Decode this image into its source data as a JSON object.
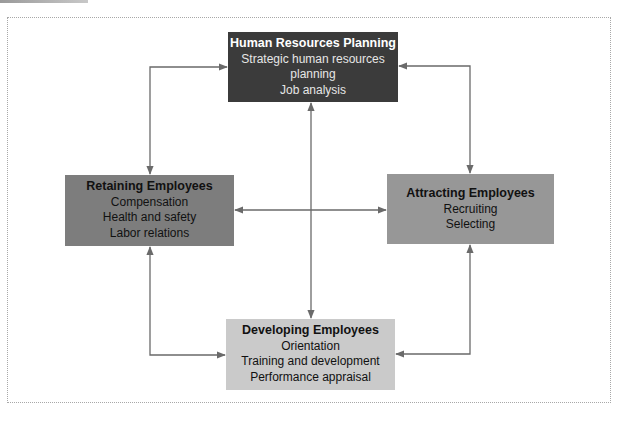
{
  "diagram": {
    "colors": {
      "hr_planning": "#3b3b3b",
      "retaining": "#7d7d7d",
      "attracting": "#979797",
      "developing": "#cacaca",
      "arrow": "#6a6a6a",
      "frame_border": "#a8a8a8"
    },
    "boxes": {
      "hr_planning": {
        "title": "Human Resources Planning",
        "items": [
          "Strategic human resources",
          "planning",
          "Job analysis"
        ]
      },
      "retaining": {
        "title": "Retaining Employees",
        "items": [
          "Compensation",
          "Health and safety",
          "Labor relations"
        ]
      },
      "attracting": {
        "title": "Attracting Employees",
        "items": [
          "Recruiting",
          "Selecting"
        ]
      },
      "developing": {
        "title": "Developing Employees",
        "items": [
          "Orientation",
          "Training and development",
          "Performance appraisal"
        ]
      }
    },
    "connections": [
      {
        "from": "Retaining Employees",
        "to": "Human Resources Planning",
        "type": "bidirectional"
      },
      {
        "from": "Attracting Employees",
        "to": "Human Resources Planning",
        "type": "bidirectional"
      },
      {
        "from": "Retaining Employees",
        "to": "Developing Employees",
        "type": "bidirectional"
      },
      {
        "from": "Attracting Employees",
        "to": "Developing Employees",
        "type": "bidirectional"
      },
      {
        "from": "Retaining Employees",
        "to": "Attracting Employees",
        "type": "bidirectional"
      },
      {
        "from": "Human Resources Planning",
        "to": "Developing Employees",
        "type": "bidirectional"
      }
    ]
  }
}
